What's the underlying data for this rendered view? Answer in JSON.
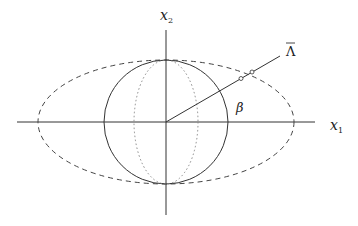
{
  "diagram": {
    "labels": {
      "x1": "x",
      "x1_sub": "1",
      "x2": "x",
      "x2_sub": "2",
      "lambda": "Λ",
      "beta": "β"
    },
    "geometry": {
      "center": [
        166,
        122
      ],
      "axis_h": [
        17,
        315
      ],
      "axis_v": [
        30,
        215
      ],
      "circle_r": 62,
      "ellipse_rx": 128,
      "ellipse_ry": 62,
      "inner_ellipse_rx": 32,
      "ray_end": [
        280,
        56
      ]
    },
    "colors": {
      "stroke": "#333333",
      "dotted": "#888888"
    }
  }
}
